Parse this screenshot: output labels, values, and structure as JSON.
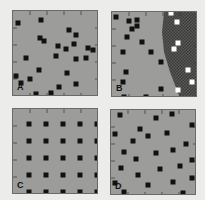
{
  "colors": {
    "background": "#ececea",
    "panel_fill": "#9c9c9a",
    "panel_border": "#6a6a68",
    "dot_dark": "#111111",
    "dot_light": "#ffffff",
    "hatch_dark": "#4a4a48"
  },
  "panels": [
    {
      "label": "A",
      "description": "random distribution",
      "left": 12,
      "top": 10,
      "dots": [
        [
          5,
          12
        ],
        [
          28,
          9
        ],
        [
          56,
          19
        ],
        [
          63,
          24
        ],
        [
          27,
          27
        ],
        [
          31,
          30
        ],
        [
          75,
          37
        ],
        [
          45,
          35
        ],
        [
          53,
          38
        ],
        [
          61,
          33
        ],
        [
          80,
          39
        ],
        [
          13,
          47
        ],
        [
          43,
          45
        ],
        [
          63,
          48
        ],
        [
          73,
          47
        ],
        [
          26,
          59
        ],
        [
          54,
          62
        ],
        [
          3,
          65
        ],
        [
          8,
          72
        ],
        [
          17,
          68
        ],
        [
          46,
          76
        ],
        [
          63,
          73
        ],
        [
          23,
          83
        ],
        [
          38,
          82
        ],
        [
          58,
          90
        ]
      ]
    },
    {
      "label": "B",
      "description": "random distribution with hatched region",
      "left": 111,
      "top": 11,
      "boundary": [
        [
          52,
          0
        ],
        [
          86,
          0
        ],
        [
          86,
          86
        ],
        [
          68,
          86
        ],
        [
          58,
          60
        ],
        [
          52,
          40
        ],
        [
          50,
          20
        ]
      ],
      "dots": [
        [
          4,
          5
        ],
        [
          17,
          9
        ],
        [
          25,
          8
        ],
        [
          25,
          14
        ],
        [
          20,
          17
        ],
        [
          15,
          25
        ],
        [
          30,
          30
        ],
        [
          11,
          40
        ],
        [
          39,
          40
        ],
        [
          49,
          50
        ],
        [
          14,
          60
        ],
        [
          49,
          77
        ],
        [
          11,
          70
        ],
        [
          42,
          87
        ],
        [
          12,
          85
        ],
        [
          34,
          85
        ]
      ],
      "light_dots": [
        [
          59,
          1
        ],
        [
          65,
          10
        ],
        [
          66,
          31
        ],
        [
          62,
          37
        ],
        [
          76,
          58
        ],
        [
          80,
          70
        ],
        [
          66,
          78
        ]
      ]
    },
    {
      "label": "C",
      "description": "regular grid",
      "left": 12,
      "top": 108,
      "rows": 5,
      "cols": 5,
      "grid_origin": [
        16,
        15
      ],
      "grid_step": [
        17,
        17
      ]
    },
    {
      "label": "D",
      "description": "uniform dispersed distribution",
      "left": 110,
      "top": 109,
      "dots": [
        [
          9,
          5
        ],
        [
          45,
          8
        ],
        [
          61,
          4
        ],
        [
          81,
          15
        ],
        [
          29,
          19
        ],
        [
          4,
          24
        ],
        [
          56,
          23
        ],
        [
          37,
          26
        ],
        [
          22,
          31
        ],
        [
          75,
          34
        ],
        [
          13,
          42
        ],
        [
          45,
          43
        ],
        [
          62,
          40
        ],
        [
          25,
          49
        ],
        [
          81,
          50
        ],
        [
          49,
          59
        ],
        [
          10,
          58
        ],
        [
          69,
          56
        ],
        [
          81,
          68
        ],
        [
          27,
          65
        ],
        [
          4,
          73
        ],
        [
          62,
          72
        ],
        [
          37,
          75
        ],
        [
          13,
          82
        ],
        [
          72,
          83
        ]
      ]
    }
  ],
  "tick_marks": "short ticks along panel edges"
}
